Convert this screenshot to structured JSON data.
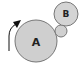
{
  "diagram": {
    "title": "",
    "nodes": [
      {
        "id": "A",
        "label": "A",
        "shape": "circle",
        "fill": "#cfcfcf",
        "stroke": "#777777"
      },
      {
        "id": "B",
        "label": "B",
        "shape": "circle",
        "fill": "#d4d4d4",
        "stroke": "#777777"
      },
      {
        "id": "idler",
        "label": "",
        "shape": "circle",
        "fill": "#d0d0d0",
        "stroke": "#777777"
      }
    ],
    "arrow": {
      "direction": "counter-clockwise rotation indicator",
      "color": "#111111"
    }
  }
}
